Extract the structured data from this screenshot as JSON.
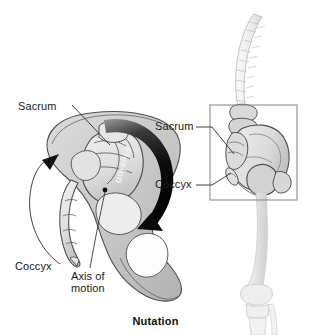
{
  "figure": {
    "caption": "Nutation",
    "left_panel": {
      "view": "lateral-pelvis-sagittal",
      "labels": {
        "sacrum": "Sacrum",
        "coccyx": "Coccyx",
        "axis_line1": "Axis of",
        "axis_line2": "motion"
      },
      "arrow_label": "Flexion"
    },
    "right_panel": {
      "view": "spine-pelvis-femur-oblique",
      "labels": {
        "sacrum": "Sacrum",
        "coccyx": "Coccyx"
      },
      "has_inset_box": true
    },
    "colors": {
      "bone_fill": "#cfcfcf",
      "bone_fill_light": "#e8e8e8",
      "bone_outline": "#4a4a4a",
      "arrow_dark": "#121212",
      "label_text": "#1a1a1a",
      "box_stroke": "#8c8c8c",
      "background": "#ffffff"
    }
  }
}
